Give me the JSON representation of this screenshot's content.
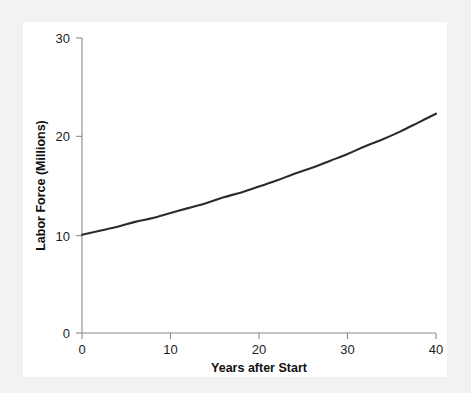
{
  "chart_data": {
    "type": "line",
    "title": "",
    "subtitle": "",
    "xlabel": "Years after Start",
    "ylabel": "Labor Force (Millions)",
    "xlim": [
      0,
      40
    ],
    "ylim": [
      0,
      30
    ],
    "xticks": [
      "0",
      "10",
      "20",
      "30",
      "40"
    ],
    "yticks": [
      "0",
      "10",
      "20",
      "30"
    ],
    "xtick_values": [
      0,
      10,
      20,
      30,
      40
    ],
    "ytick_values": [
      0,
      10,
      20,
      30
    ],
    "grid": false,
    "legend": null,
    "legend_position": "none",
    "annotations": [],
    "line_color": "#2b2b2b",
    "axis_color": "#8a8a8a",
    "background_color": "#ffffff",
    "page_background_color": "#f2f2f2",
    "series": [
      {
        "name": "Labor Force",
        "x": [
          0,
          2,
          4,
          6,
          8,
          10,
          12,
          14,
          16,
          18,
          20,
          22,
          24,
          26,
          28,
          30,
          32,
          34,
          36,
          38,
          40
        ],
        "values": [
          10.0,
          10.4,
          10.8,
          11.3,
          11.7,
          12.2,
          12.7,
          13.2,
          13.8,
          14.3,
          14.9,
          15.5,
          16.2,
          16.8,
          17.5,
          18.2,
          19.0,
          19.7,
          20.5,
          21.4,
          22.3
        ]
      }
    ]
  },
  "axes": {
    "x_title": "Years after Start",
    "y_title": "Labor Force (Millions)"
  }
}
